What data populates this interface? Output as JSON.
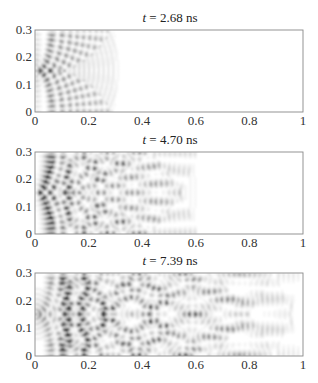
{
  "chart_data": [
    {
      "type": "heatmap",
      "title": "t = 2.68 ns",
      "title_var": "t",
      "title_value": "= 2.68 ns",
      "xlim": [
        0,
        1
      ],
      "ylim": [
        0,
        0.3
      ],
      "xticks": [
        "0",
        "0.2",
        "0.4",
        "0.6",
        "0.8",
        "1"
      ],
      "yticks": [
        "0",
        "0.1",
        "0.2",
        "0.3"
      ],
      "colormap": "grayscale (white = 0, dark = high intensity)",
      "wavefront_extent_x": 0.32,
      "source": {
        "x": 0.0,
        "y": 0.15
      },
      "description": "Circular wavefronts emanating from source at (0, 0.15), reaching x≈0.32"
    },
    {
      "type": "heatmap",
      "title": "t = 4.70 ns",
      "title_var": "t",
      "title_value": "= 4.70 ns",
      "xlim": [
        0,
        1
      ],
      "ylim": [
        0,
        0.3
      ],
      "xticks": [
        "0",
        "0.2",
        "0.4",
        "0.6",
        "0.8",
        "1"
      ],
      "yticks": [
        "0",
        "0.1",
        "0.2",
        "0.3"
      ],
      "colormap": "grayscale",
      "wavefront_extent_x": 0.62,
      "source": {
        "x": 0.0,
        "y": 0.15
      },
      "description": "Wavefronts reflected from top/bottom walls forming interference pattern, reaching x≈0.62"
    },
    {
      "type": "heatmap",
      "title": "t = 7.39 ns",
      "title_var": "t",
      "title_value": "= 7.39 ns",
      "xlim": [
        0,
        1
      ],
      "ylim": [
        0,
        0.3
      ],
      "xticks": [
        "0",
        "0.2",
        "0.4",
        "0.6",
        "0.8",
        "1"
      ],
      "yticks": [
        "0",
        "0.1",
        "0.2",
        "0.3"
      ],
      "colormap": "grayscale",
      "wavefront_extent_x": 1.0,
      "source": {
        "x": 0.0,
        "y": 0.15
      },
      "description": "Interference pattern fills entire waveguide domain"
    }
  ],
  "layout": {
    "panels": [
      {
        "x0": 35,
        "x1": 303,
        "y0": 30,
        "y1": 112,
        "title_y": 22
      },
      {
        "x0": 35,
        "x1": 303,
        "y0": 152,
        "y1": 234,
        "title_y": 144
      },
      {
        "x0": 35,
        "x1": 303,
        "y0": 273,
        "y1": 356,
        "title_y": 265
      }
    ]
  }
}
